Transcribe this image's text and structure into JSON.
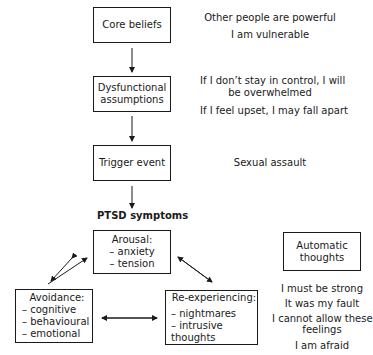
{
  "diagram": {
    "flow_boxes": [
      {
        "id": "core-beliefs",
        "label": "Core beliefs"
      },
      {
        "id": "dysfunctional-assumptions",
        "label_lines": [
          "Dysfunctional",
          "assumptions"
        ]
      },
      {
        "id": "trigger-event",
        "label": "Trigger event"
      }
    ],
    "right_annotations": {
      "core_beliefs": [
        "Other people are powerful",
        "I am vulnerable"
      ],
      "assumptions": {
        "first": [
          "If I don’t stay in control, I will",
          "be overwhelmed"
        ],
        "second": "If I feel upset, I may fall apart"
      },
      "trigger": "Sexual assault"
    },
    "ptsd_heading": "PTSD symptoms",
    "symptom_boxes": {
      "arousal": {
        "title": "Arousal:",
        "items": [
          "– anxiety",
          "– tension"
        ]
      },
      "avoidance": {
        "title": "Avoidance:",
        "items": [
          "– cognitive",
          "– behavioural",
          "– emotional"
        ]
      },
      "reexperiencing": {
        "title": "Re-experiencing:",
        "items": [
          "– nightmares",
          "– intrusive thoughts"
        ]
      }
    },
    "automatic_thoughts": {
      "title_lines": [
        "Automatic",
        "thoughts"
      ],
      "items": [
        "I must be strong",
        "It was my fault",
        "I cannot allow these",
        "feelings",
        "I am afraid"
      ]
    }
  }
}
